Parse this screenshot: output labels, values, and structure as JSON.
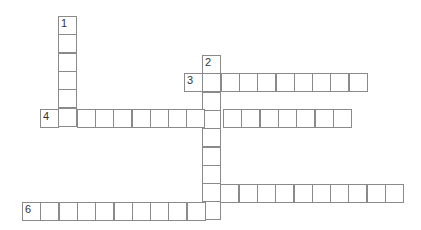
{
  "puzzle": {
    "type": "crossword",
    "cell_size": 18.3,
    "clues_shown": false,
    "entries": [
      {
        "number": "1",
        "direction": "down",
        "x": 58,
        "y": 16,
        "length": 6
      },
      {
        "number": "2",
        "direction": "down",
        "x": 202,
        "y": 55,
        "length": 9
      },
      {
        "number": "3",
        "direction": "across",
        "x": 184,
        "y": 73,
        "length": 10
      },
      {
        "number": "4",
        "direction": "across",
        "x": 40,
        "y": 109,
        "length": 17
      },
      {
        "number": "5",
        "direction": "across",
        "x": 202,
        "y": 184,
        "length": 11
      },
      {
        "number": "6",
        "direction": "across",
        "x": 22,
        "y": 202,
        "length": 11
      }
    ]
  }
}
